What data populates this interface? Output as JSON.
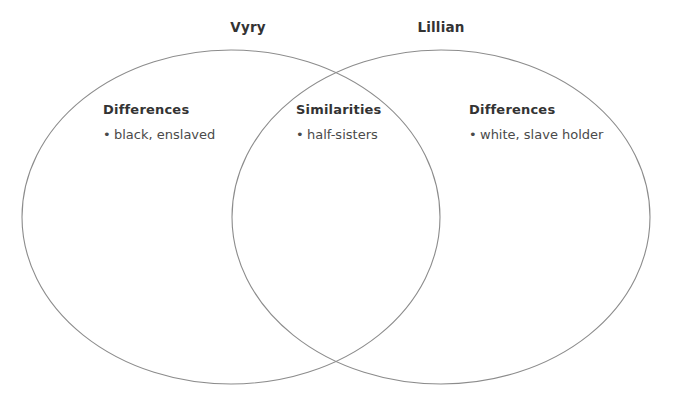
{
  "diagram": {
    "type": "venn",
    "kind": "two-circle-venn-diagram",
    "stroke_color": "#8c8c8c",
    "text_color": "#3a3a3a",
    "heading_color": "#333333",
    "background_color": "#ffffff",
    "bullet_glyph": "•",
    "sets": [
      {
        "id": "left",
        "title": "Vyry",
        "heading": "Differences",
        "items": [
          "black, enslaved"
        ]
      },
      {
        "id": "right",
        "title": "Lillian",
        "heading": "Differences",
        "items": [
          "white, slave holder"
        ]
      }
    ],
    "overlap": {
      "id": "center",
      "heading": "Similarities",
      "items": [
        "half-sisters"
      ]
    }
  }
}
